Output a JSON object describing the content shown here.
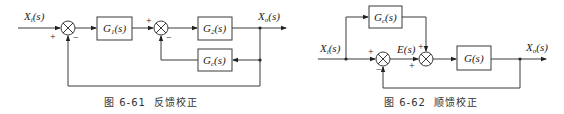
{
  "figures": [
    {
      "id": "6-61",
      "caption_number": "图 6-61",
      "caption_title": "反馈校正",
      "input_label": "X_i(s)",
      "output_label": "X_o(s)",
      "blocks": [
        {
          "name": "G1",
          "label": "G₁(s)"
        },
        {
          "name": "G2",
          "label": "G₂(s)"
        },
        {
          "name": "Gc",
          "label": "G_c(s)"
        }
      ],
      "sum1_signs": {
        "input": "+",
        "feedback": "−"
      },
      "sum2_signs": {
        "input": "+",
        "feedback": "−"
      }
    },
    {
      "id": "6-62",
      "caption_number": "图 6-62",
      "caption_title": "顺馈校正",
      "input_label": "X_i(s)",
      "output_label": "X_o(s)",
      "error_label": "E(s)",
      "blocks": [
        {
          "name": "Gc",
          "label": "G_c(s)"
        },
        {
          "name": "G",
          "label": "G(s)"
        }
      ],
      "sum1_signs": {
        "input": "+",
        "feedback": "−"
      },
      "sum2_signs": {
        "error": "+",
        "feedforward": "+"
      }
    }
  ],
  "colors": {
    "line": "#3a3a3a",
    "text": "#222222",
    "background": "#ffffff"
  }
}
